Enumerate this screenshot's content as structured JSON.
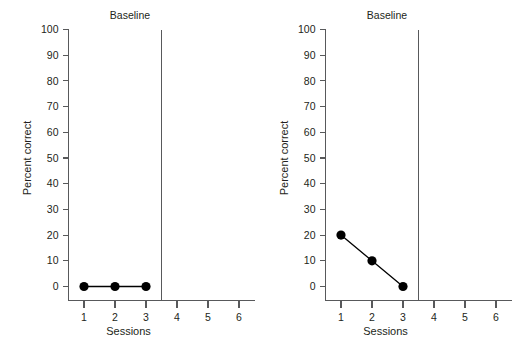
{
  "figure": {
    "background_color": "#ffffff",
    "axis_color": "#58595b",
    "data_color": "#000000",
    "text_color": "#231f20"
  },
  "panels": [
    {
      "id": "left",
      "title": "Baseline",
      "xlabel": "Sessions",
      "ylabel": "Percent correct",
      "phase_line_x": 3.5
    },
    {
      "id": "right",
      "title": "Baseline",
      "xlabel": "Sessions",
      "ylabel": "Percent correct",
      "phase_line_x": 3.5
    }
  ],
  "axes": {
    "y_ticks": [
      0,
      10,
      20,
      30,
      40,
      50,
      60,
      70,
      80,
      90,
      100
    ],
    "y_tick_labels": [
      "0",
      "10",
      "20",
      "30",
      "40",
      "50",
      "60",
      "70",
      "80",
      "90",
      "100"
    ],
    "x_ticks": [
      1,
      2,
      3,
      4,
      5,
      6
    ],
    "x_tick_labels": [
      "1",
      "2",
      "3",
      "4",
      "5",
      "6"
    ],
    "ylim": [
      0,
      100
    ],
    "xlim": [
      0.5,
      6.5
    ]
  },
  "chart_data": [
    {
      "type": "line",
      "panel": "left",
      "title": "Baseline",
      "xlabel": "Sessions",
      "ylabel": "Percent correct",
      "x": [
        1,
        2,
        3
      ],
      "values": [
        0,
        0,
        0
      ],
      "series": [
        {
          "name": "Baseline",
          "x": [
            1,
            2,
            3
          ],
          "values": [
            0,
            0,
            0
          ]
        }
      ],
      "xlim": [
        0.5,
        6.5
      ],
      "ylim": [
        0,
        100
      ],
      "x_ticks": [
        1,
        2,
        3,
        4,
        5,
        6
      ],
      "y_ticks": [
        0,
        10,
        20,
        30,
        40,
        50,
        60,
        70,
        80,
        90,
        100
      ],
      "grid": false,
      "legend": "none",
      "annotations": [
        {
          "type": "phase-line",
          "orientation": "vertical",
          "x": 3.5,
          "label": ""
        }
      ],
      "marker": "filled-circle",
      "marker_color": "#000000",
      "line_color": "#000000"
    },
    {
      "type": "line",
      "panel": "right",
      "title": "Baseline",
      "xlabel": "Sessions",
      "ylabel": "Percent correct",
      "x": [
        1,
        2,
        3
      ],
      "values": [
        20,
        10,
        0
      ],
      "series": [
        {
          "name": "Baseline",
          "x": [
            1,
            2,
            3
          ],
          "values": [
            20,
            10,
            0
          ]
        }
      ],
      "xlim": [
        0.5,
        6.5
      ],
      "ylim": [
        0,
        100
      ],
      "x_ticks": [
        1,
        2,
        3,
        4,
        5,
        6
      ],
      "y_ticks": [
        0,
        10,
        20,
        30,
        40,
        50,
        60,
        70,
        80,
        90,
        100
      ],
      "grid": false,
      "legend": "none",
      "annotations": [
        {
          "type": "phase-line",
          "orientation": "vertical",
          "x": 3.5,
          "label": ""
        }
      ],
      "marker": "filled-circle",
      "marker_color": "#000000",
      "line_color": "#000000"
    }
  ]
}
